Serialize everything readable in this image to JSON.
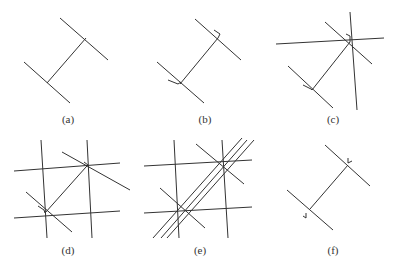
{
  "figure": {
    "panels": [
      {
        "id": "a",
        "label": "(a)",
        "label_pos": [
          68,
          113
        ],
        "lines": [
          [
            60,
            18,
            108,
            60
          ],
          [
            24,
            62,
            70,
            103
          ],
          [
            47,
            83,
            86,
            38
          ]
        ],
        "marks": []
      },
      {
        "id": "b",
        "label": "(b)",
        "label_pos": [
          205,
          113
        ],
        "lines": [
          [
            195,
            19,
            241,
            60
          ],
          [
            157,
            62,
            204,
            103
          ],
          [
            180,
            84,
            218,
            38
          ]
        ],
        "marks": [
          [
            214,
            30,
            220,
            34,
            218,
            38
          ],
          [
            168,
            80,
            178,
            84,
            181,
            82
          ]
        ]
      },
      {
        "id": "c",
        "label": "(c)",
        "label_pos": [
          333,
          113
        ],
        "lines": [
          [
            325,
            22,
            372,
            64
          ],
          [
            288,
            66,
            333,
            108
          ],
          [
            312,
            90,
            350,
            42
          ],
          [
            276,
            44,
            384,
            38
          ],
          [
            350,
            12,
            357,
            110
          ]
        ],
        "marks": [
          [
            346,
            34,
            350,
            36,
            350,
            42
          ],
          [
            303,
            85,
            311,
            89,
            312,
            90
          ]
        ]
      },
      {
        "id": "d",
        "label": "(d)",
        "label_pos": [
          68,
          244
        ],
        "lines": [
          [
            62,
            152,
            130,
            190
          ],
          [
            26,
            192,
            72,
            232
          ],
          [
            45,
            213,
            86,
            167
          ],
          [
            14,
            171,
            120,
            163
          ],
          [
            14,
            218,
            120,
            211
          ],
          [
            41,
            140,
            47,
            238
          ],
          [
            87,
            140,
            92,
            238
          ]
        ],
        "marks": [
          [
            84,
            162,
            88,
            165,
            86,
            167
          ],
          [
            38,
            206,
            44,
            210,
            45,
            213
          ]
        ]
      },
      {
        "id": "e",
        "label": "(e)",
        "label_pos": [
          200,
          244
        ],
        "lines": [
          [
            196,
            144,
            244,
            184
          ],
          [
            160,
            188,
            205,
            228
          ],
          [
            144,
            166,
            252,
            160
          ],
          [
            144,
            213,
            252,
            207
          ],
          [
            174,
            140,
            179,
            238
          ],
          [
            222,
            140,
            228,
            238
          ],
          [
            153,
            238,
            242,
            138
          ],
          [
            161,
            238,
            247,
            140
          ],
          [
            167,
            238,
            254,
            140
          ]
        ],
        "marks": []
      },
      {
        "id": "f",
        "label": "(f)",
        "label_pos": [
          333,
          244
        ],
        "lines": [
          [
            325,
            145,
            370,
            186
          ],
          [
            287,
            190,
            333,
            230
          ],
          [
            310,
            209,
            348,
            165
          ]
        ],
        "marks": [
          [
            348,
            158,
            348,
            163,
            352,
            161
          ],
          [
            306,
            213,
            306,
            218,
            303,
            216
          ]
        ]
      }
    ]
  }
}
